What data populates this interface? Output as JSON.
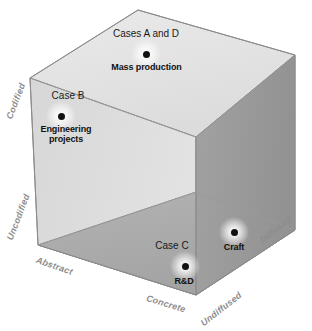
{
  "diagram": {
    "type": "3d-cube-scatter",
    "colors": {
      "top_face": "#e3e3e3",
      "left_face": "#dcdcdc",
      "right_face": "#9b9b9b",
      "floor_face": "#acacac",
      "back_left_face": "#c9c9c9",
      "edge": "#8f8f8f",
      "axis_label": "#8d8d8d",
      "point": "#121212",
      "background": "#ffffff"
    },
    "axes": [
      {
        "id": "codification-high",
        "label": "Codified",
        "position": "upper-left-vertical"
      },
      {
        "id": "codification-low",
        "label": "Uncodified",
        "position": "lower-left-vertical"
      },
      {
        "id": "abstraction-low",
        "label": "Abstract",
        "position": "bottom-left-diagonal"
      },
      {
        "id": "abstraction-high",
        "label": "Concrete",
        "position": "bottom-center-diagonal"
      },
      {
        "id": "diffusion-low",
        "label": "Undiffused",
        "position": "bottom-right-diagonal"
      },
      {
        "id": "diffusion-high",
        "label": "Diffused",
        "position": "right-edge-diagonal"
      }
    ],
    "points": [
      {
        "id": "cases-a-d",
        "case_label": "Cases A and D",
        "value_label": "Mass production",
        "x": 146,
        "y": 54
      },
      {
        "id": "case-b",
        "case_label": "Case B",
        "value_label": "Engineering\nprojects",
        "x": 61,
        "y": 116
      },
      {
        "id": "case-c",
        "case_label": "Case C",
        "value_label": "R&D",
        "x": 185,
        "y": 266
      },
      {
        "id": "craft",
        "case_label": "",
        "value_label": "Craft",
        "x": 234,
        "y": 232
      }
    ],
    "point_labels": {
      "cases_a_d_case": "Cases A and D",
      "cases_a_d_value": "Mass production",
      "case_b_case": "Case B",
      "case_b_value_line1": "Engineering",
      "case_b_value_line2": "projects",
      "case_c_case": "Case C",
      "case_c_value": "R&D",
      "craft_value": "Craft"
    }
  }
}
